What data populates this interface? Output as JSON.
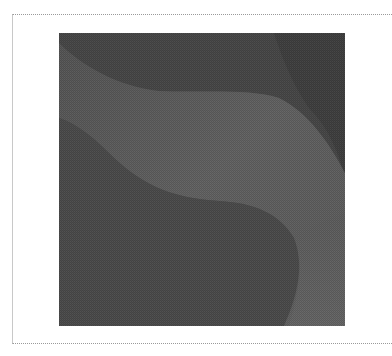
{
  "frame": {
    "border_style": "dotted",
    "border_color": "#9a9a9a"
  },
  "image": {
    "description": "Abstract gray wave wallpaper with flowing S-shaped bands",
    "colors": {
      "base": "#505050",
      "dark": "#3e3e3e",
      "mid": "#5a5a5a",
      "light": "#646464",
      "lower_blob": "#4c4c4c",
      "lower_right": "#5e5e5e"
    }
  }
}
